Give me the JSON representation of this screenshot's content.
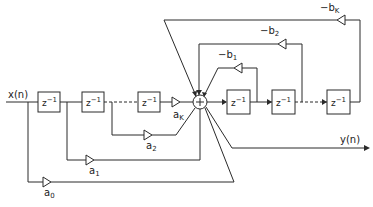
{
  "diagram": {
    "type": "signal-flow / IIR filter direct form",
    "input_label": "x(n)",
    "output_label": "y(n)",
    "summer_symbol": "+",
    "delay_label": "z",
    "delay_exp": "−1",
    "feedforward": [
      {
        "name": "a",
        "sub": "0"
      },
      {
        "name": "a",
        "sub": "1"
      },
      {
        "name": "a",
        "sub": "2"
      },
      {
        "name": "a",
        "sub": "K"
      }
    ],
    "feedback": [
      {
        "name": "−b",
        "sub": "1"
      },
      {
        "name": "−b",
        "sub": "2"
      },
      {
        "name": "−b",
        "sub": "K"
      }
    ]
  }
}
